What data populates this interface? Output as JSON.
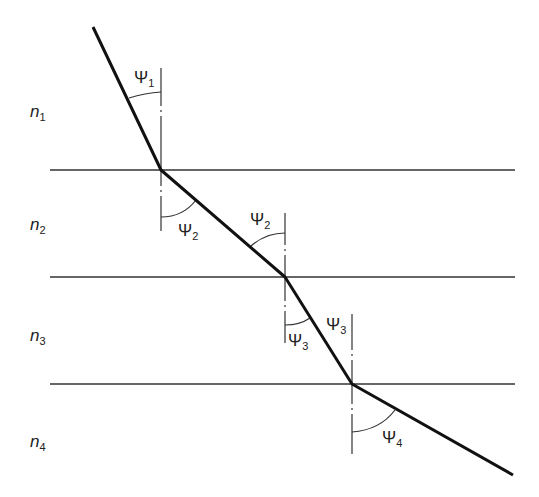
{
  "diagram": {
    "title": "",
    "media": [
      {
        "label": "n",
        "sub": "1",
        "x": 30,
        "y": 117
      },
      {
        "label": "n",
        "sub": "2",
        "x": 30,
        "y": 230
      },
      {
        "label": "n",
        "sub": "3",
        "x": 30,
        "y": 341
      },
      {
        "label": "n",
        "sub": "4",
        "x": 30,
        "y": 447
      }
    ],
    "interfaces_y": [
      170,
      277,
      384
    ],
    "ray_points": [
      [
        93,
        27
      ],
      [
        161,
        170
      ],
      [
        285,
        277
      ],
      [
        352,
        384
      ],
      [
        513,
        475
      ]
    ],
    "angles": [
      {
        "label": "Ψ",
        "sub": "1",
        "x": 134,
        "y": 83
      },
      {
        "label": "Ψ",
        "sub": "2",
        "x": 178,
        "y": 236
      },
      {
        "label": "Ψ",
        "sub": "2",
        "x": 250,
        "y": 225
      },
      {
        "label": "Ψ",
        "sub": "3",
        "x": 288,
        "y": 346
      },
      {
        "label": "Ψ",
        "sub": "3",
        "x": 326,
        "y": 330
      },
      {
        "label": "Ψ",
        "sub": "4",
        "x": 382,
        "y": 443
      }
    ],
    "line_color": "#1a1a1a"
  }
}
